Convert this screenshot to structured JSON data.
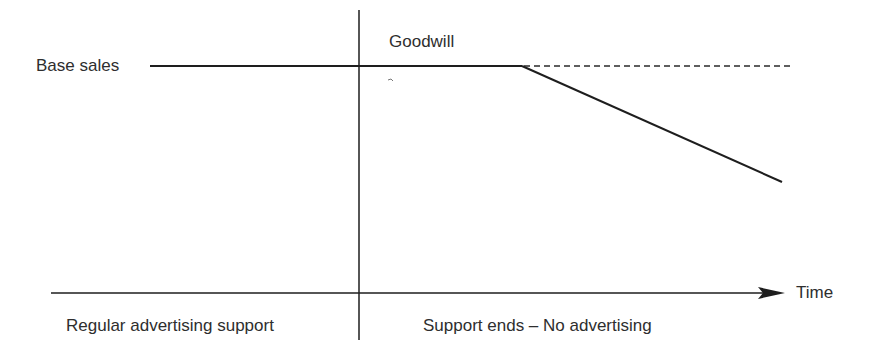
{
  "diagram": {
    "title": "",
    "labels": {
      "base_sales": "Base sales",
      "goodwill": "Goodwill",
      "time_axis": "Time",
      "period_before": "Regular advertising support",
      "period_after": "Support ends – No advertising"
    },
    "colors": {
      "line": "#1e1e1e",
      "text": "#2e2e2e",
      "background": "#ffffff"
    },
    "elements": {
      "base_sales_line": {
        "x1": 150,
        "y1": 66,
        "x2": 522,
        "y2": 66,
        "style": "solid"
      },
      "baseline_projection": {
        "x1": 522,
        "y1": 66,
        "x2": 790,
        "y2": 66,
        "style": "dashed"
      },
      "decline_line": {
        "x1": 522,
        "y1": 66,
        "x2": 782,
        "y2": 182,
        "style": "solid"
      },
      "divider_line": {
        "x1": 359,
        "y1": 10,
        "x2": 359,
        "y2": 340,
        "style": "solid"
      },
      "time_axis": {
        "x1": 51,
        "y1": 293,
        "x2": 785,
        "y2": 293,
        "style": "arrow"
      }
    }
  }
}
